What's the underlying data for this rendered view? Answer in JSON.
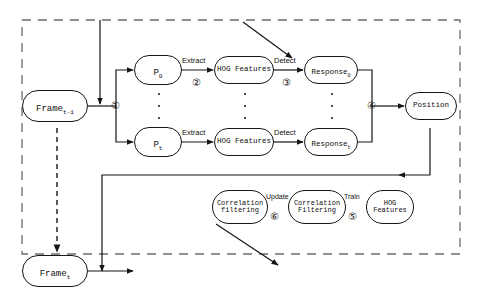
{
  "figure": {
    "type": "flowchart"
  },
  "nodes": {
    "frame_prev": {
      "label": "Frame",
      "subscript": "t-1"
    },
    "frame_curr": {
      "label": "Frame",
      "subscript": "t"
    },
    "patch_first": {
      "label": "P",
      "subscript": "0"
    },
    "patch_last": {
      "label": "P",
      "subscript": "t"
    },
    "hog_top": {
      "label": "HOG Features",
      "subscript": ""
    },
    "hog_bottom": {
      "label": "HOG Features",
      "subscript": ""
    },
    "response_top": {
      "label": "Response",
      "subscript": "0"
    },
    "response_bottom": {
      "label": "Response",
      "subscript": "t"
    },
    "position": {
      "label": "Position",
      "subscript": ""
    },
    "correlation_filtering_left": {
      "label": "Correlation\nfiltering",
      "subscript": ""
    },
    "correlation_filtering_mid": {
      "label": "Correlation\nFiltering",
      "subscript": ""
    },
    "hog_features_bottom": {
      "label": "HOG\nFeatures",
      "subscript": ""
    }
  },
  "edge_labels": {
    "extract_top": "Extract",
    "extract_bottom": "Extract",
    "detect_top": "Detect",
    "detect_bottom": "Detect",
    "update": "Update",
    "train": "Train"
  },
  "steps": {
    "one": "①",
    "two": "②",
    "three": "③",
    "four": "④",
    "five": "⑤",
    "six": "⑥"
  },
  "colors": {
    "stroke": "#151515",
    "dashed_border": "#6b6b6b",
    "background": "#ffffff",
    "text": "#101010"
  }
}
